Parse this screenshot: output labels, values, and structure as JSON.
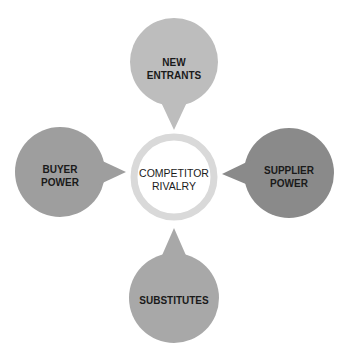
{
  "diagram": {
    "center": {
      "label": "COMPETITOR\nRIVALRY",
      "ring_color": "#d9d9d9"
    },
    "forces": [
      {
        "id": "top",
        "label": "NEW\nENTRANTS",
        "color": "#bdbdbd"
      },
      {
        "id": "left",
        "label": "BUYER\nPOWER",
        "color": "#9e9e9e"
      },
      {
        "id": "right",
        "label": "SUPPLIER\nPOWER",
        "color": "#8a8a8a"
      },
      {
        "id": "bottom",
        "label": "SUBSTITUTES",
        "color": "#a8a8a8"
      }
    ]
  }
}
